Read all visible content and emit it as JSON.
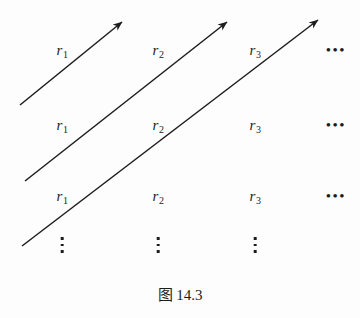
{
  "figure": {
    "caption": "图 14.3",
    "caption_y": 288,
    "background_color": "#fdfdfd",
    "ink_color": "#1c1c1c",
    "width": 360,
    "height": 318
  },
  "grid": {
    "row_y": [
      50,
      125,
      196
    ],
    "column_x": [
      62,
      158,
      255
    ],
    "ellipsis_x": 336,
    "labels": [
      [
        "r1",
        "r2",
        "r3"
      ],
      [
        "r1",
        "r2",
        "r3"
      ],
      [
        "r1",
        "r2",
        "r3"
      ]
    ],
    "label_text": {
      "r1_base": "r",
      "r1_sub": "1",
      "r2_base": "r",
      "r2_sub": "2",
      "r3_base": "r",
      "r3_sub": "3"
    },
    "horizontal_ellipsis": "•••",
    "vertical_ellipsis_y": 245,
    "vertical_ellipsis_x": [
      62,
      158,
      255
    ]
  },
  "arrows": [
    {
      "name": "diagonal-arrow-1",
      "x1": 20,
      "y1": 105,
      "x2": 122,
      "y2": 22
    },
    {
      "name": "diagonal-arrow-2",
      "x1": 25,
      "y1": 181,
      "x2": 227,
      "y2": 22
    },
    {
      "name": "diagonal-arrow-3",
      "x1": 22,
      "y1": 246,
      "x2": 318,
      "y2": 20
    }
  ]
}
